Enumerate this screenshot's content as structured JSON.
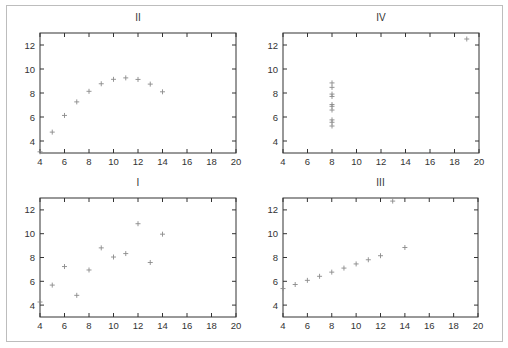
{
  "chart_data": [
    {
      "type": "scatter",
      "title": "II",
      "position": "top-left",
      "xlim": [
        4,
        20
      ],
      "ylim": [
        3,
        13
      ],
      "xticks": [
        4,
        6,
        8,
        10,
        12,
        14,
        16,
        18,
        20
      ],
      "yticks": [
        4,
        6,
        8,
        10,
        12
      ],
      "x": [
        10,
        8,
        13,
        9,
        11,
        14,
        6,
        4,
        12,
        7,
        5
      ],
      "y": [
        9.14,
        8.14,
        8.74,
        8.77,
        9.26,
        8.1,
        6.13,
        3.1,
        9.13,
        7.26,
        4.74
      ],
      "marker": "+"
    },
    {
      "type": "scatter",
      "title": "IV",
      "position": "top-right",
      "xlim": [
        4,
        20
      ],
      "ylim": [
        3,
        13
      ],
      "xticks": [
        4,
        6,
        8,
        10,
        12,
        14,
        16,
        18,
        20
      ],
      "yticks": [
        4,
        6,
        8,
        10,
        12
      ],
      "x": [
        8,
        8,
        8,
        8,
        8,
        8,
        8,
        19,
        8,
        8,
        8
      ],
      "y": [
        6.58,
        5.76,
        7.71,
        8.84,
        8.47,
        7.04,
        5.25,
        12.5,
        5.56,
        7.91,
        6.89
      ],
      "marker": "+"
    },
    {
      "type": "scatter",
      "title": "I",
      "position": "bottom-left",
      "xlim": [
        4,
        20
      ],
      "ylim": [
        3,
        13
      ],
      "xticks": [
        4,
        6,
        8,
        10,
        12,
        14,
        16,
        18,
        20
      ],
      "yticks": [
        4,
        6,
        8,
        10,
        12
      ],
      "x": [
        10,
        8,
        13,
        9,
        11,
        14,
        6,
        4,
        12,
        7,
        5
      ],
      "y": [
        8.04,
        6.95,
        7.58,
        8.81,
        8.33,
        9.96,
        7.24,
        4.26,
        10.84,
        4.82,
        5.68
      ],
      "marker": "+"
    },
    {
      "type": "scatter",
      "title": "III",
      "position": "bottom-right",
      "xlim": [
        4,
        20
      ],
      "ylim": [
        3,
        13
      ],
      "xticks": [
        4,
        6,
        8,
        10,
        12,
        14,
        16,
        18,
        20
      ],
      "yticks": [
        4,
        6,
        8,
        10,
        12
      ],
      "x": [
        10,
        8,
        13,
        9,
        11,
        14,
        6,
        4,
        12,
        7,
        5
      ],
      "y": [
        7.46,
        6.77,
        12.74,
        7.11,
        7.81,
        8.84,
        6.08,
        5.39,
        8.15,
        6.42,
        5.73
      ],
      "marker": "+"
    }
  ],
  "colors": {
    "axis": "#333333",
    "marker": "#8a8a8a",
    "frame": "#bdbdbd"
  }
}
